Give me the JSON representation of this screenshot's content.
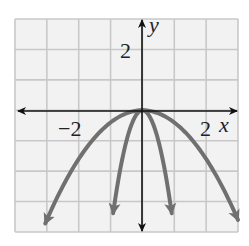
{
  "chart_data": {
    "type": "line",
    "title": "",
    "xlabel": "x",
    "ylabel": "y",
    "xlim": [
      -4,
      3
    ],
    "ylim": [
      -4,
      3
    ],
    "grid": true,
    "grid_step": 1,
    "tick_labels": {
      "x": [
        "-2",
        "2"
      ],
      "y": [
        "2"
      ]
    },
    "series": [
      {
        "name": "y = -0.4x^2",
        "a": -0.4,
        "domain": [
          -3.05,
          3.0
        ],
        "color": "#707070"
      },
      {
        "name": "y = -4x^2",
        "a": -4.0,
        "domain": [
          -0.92,
          0.92
        ],
        "color": "#707070"
      }
    ],
    "x": [
      -3,
      -2,
      -1,
      0,
      1,
      2,
      3
    ],
    "values_outer": [
      -3.6,
      -1.6,
      -0.4,
      0,
      -0.4,
      -1.6,
      -3.6
    ],
    "values_inner": [
      null,
      null,
      -4,
      0,
      -4,
      null,
      null
    ]
  },
  "labels": {
    "y_axis": "y",
    "x_axis": "x",
    "x_tick_neg": "−2",
    "x_tick_pos": "2",
    "y_tick_pos": "2"
  },
  "colors": {
    "grid": "#c8c8c8",
    "grid_bg": "#f2f2f2",
    "axis": "#111111",
    "curve": "#707070"
  }
}
